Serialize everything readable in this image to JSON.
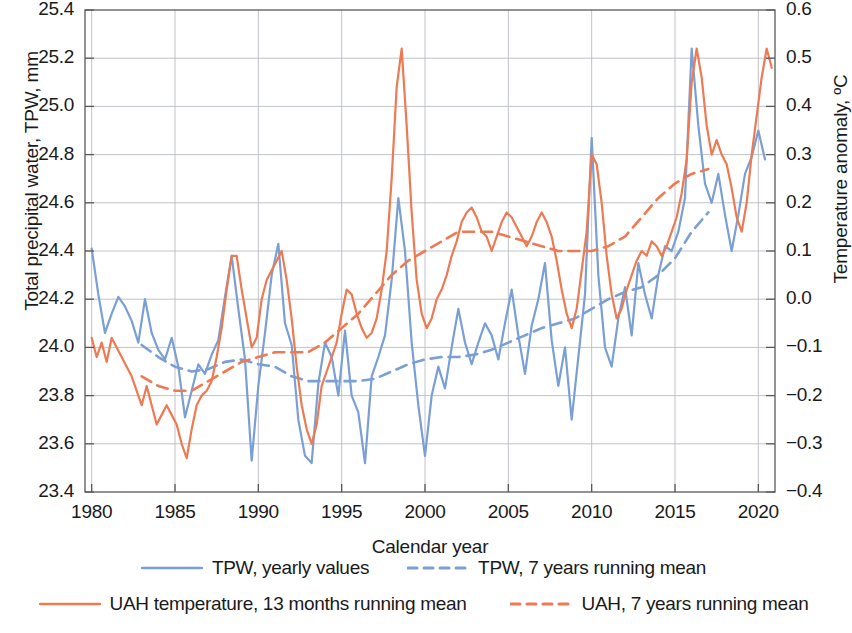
{
  "chart_data": {
    "type": "line",
    "title": "",
    "xlabel": "Calendar year",
    "ylabel": "Total precipital water, TPW, mm",
    "ylabel_right": "Temperature anomaly, ºC",
    "xlim": [
      1979.6,
      2021.0
    ],
    "ylim": [
      23.4,
      25.4
    ],
    "ylim_right": [
      -0.4,
      0.6
    ],
    "grid": true,
    "legend_position": "below",
    "xticks": [
      1980,
      1985,
      1990,
      1995,
      2000,
      2005,
      2010,
      2015,
      2020
    ],
    "xticklabels": [
      "1980",
      "1985",
      "1990",
      "1995",
      "2000",
      "2005",
      "2010",
      "2015",
      "2020"
    ],
    "yticks_left": [
      23.4,
      23.6,
      23.8,
      24.0,
      24.2,
      24.4,
      24.6,
      24.8,
      25.0,
      25.2,
      25.4
    ],
    "yticklabels_left": [
      "23.4",
      "23.6",
      "23.8",
      "24.0",
      "24.2",
      "24.4",
      "24.6",
      "24.8",
      "25.0",
      "25.2",
      "25.4"
    ],
    "yticks_right": [
      -0.4,
      -0.3,
      -0.2,
      -0.1,
      0.0,
      0.1,
      0.2,
      0.3,
      0.4,
      0.5,
      0.6
    ],
    "yticklabels_right": [
      "−0.4",
      "−0.3",
      "−0.2",
      "−0.1",
      "0.0",
      "0.1",
      "0.2",
      "0.3",
      "0.4",
      "0.5",
      "0.6"
    ],
    "colors": {
      "tpw": "#7a9fd4",
      "uah": "#ed7a52",
      "grid": "#b9bcc4",
      "frame": "#59595b"
    },
    "series": [
      {
        "name": "TPW, yearly values",
        "axis": "left",
        "color": "#7a9fd4",
        "style": "solid",
        "x": [
          1980.0,
          1980.4,
          1980.8,
          1981.2,
          1981.6,
          1982.0,
          1982.4,
          1982.8,
          1983.2,
          1983.6,
          1984.0,
          1984.4,
          1984.8,
          1985.2,
          1985.6,
          1986.0,
          1986.4,
          1986.8,
          1987.2,
          1987.6,
          1988.0,
          1988.4,
          1988.8,
          1989.2,
          1989.6,
          1990.0,
          1990.4,
          1990.8,
          1991.2,
          1991.6,
          1992.0,
          1992.4,
          1992.8,
          1993.2,
          1993.6,
          1994.0,
          1994.4,
          1994.8,
          1995.2,
          1995.6,
          1996.0,
          1996.4,
          1996.8,
          1997.2,
          1997.6,
          1998.0,
          1998.4,
          1998.8,
          1999.2,
          1999.6,
          2000.0,
          2000.4,
          2000.8,
          2001.2,
          2001.6,
          2002.0,
          2002.4,
          2002.8,
          2003.2,
          2003.6,
          2004.0,
          2004.4,
          2004.8,
          2005.2,
          2005.6,
          2006.0,
          2006.4,
          2006.8,
          2007.2,
          2007.6,
          2008.0,
          2008.4,
          2008.8,
          2009.2,
          2009.6,
          2010.0,
          2010.4,
          2010.8,
          2011.2,
          2011.6,
          2012.0,
          2012.4,
          2012.8,
          2013.2,
          2013.6,
          2014.0,
          2014.4,
          2014.8,
          2015.2,
          2015.6,
          2016.0,
          2016.4,
          2016.8,
          2017.2,
          2017.6,
          2018.0,
          2018.4,
          2018.8,
          2019.2,
          2019.6,
          2020.0,
          2020.4
        ],
        "y": [
          24.41,
          24.22,
          24.06,
          24.14,
          24.21,
          24.17,
          24.11,
          24.02,
          24.2,
          24.06,
          23.99,
          23.95,
          24.04,
          23.92,
          23.71,
          23.82,
          23.93,
          23.89,
          23.97,
          24.03,
          24.21,
          24.38,
          24.16,
          23.95,
          23.53,
          23.84,
          24.06,
          24.3,
          24.43,
          24.1,
          24.01,
          23.7,
          23.55,
          23.52,
          23.85,
          24.02,
          23.96,
          23.8,
          24.07,
          23.8,
          23.73,
          23.52,
          23.88,
          23.96,
          24.05,
          24.28,
          24.62,
          24.4,
          24.02,
          23.76,
          23.55,
          23.8,
          23.92,
          23.83,
          24.0,
          24.16,
          24.02,
          23.93,
          24.02,
          24.1,
          24.05,
          23.95,
          24.1,
          24.24,
          24.05,
          23.89,
          24.09,
          24.2,
          24.35,
          24.03,
          23.84,
          24.0,
          23.7,
          23.96,
          24.22,
          24.87,
          24.3,
          24.0,
          23.92,
          24.12,
          24.25,
          24.05,
          24.35,
          24.22,
          24.12,
          24.3,
          24.42,
          24.4,
          24.48,
          24.62,
          25.24,
          24.92,
          24.68,
          24.6,
          24.72,
          24.55,
          24.4,
          24.55,
          24.72,
          24.79,
          24.9,
          24.78
        ]
      },
      {
        "name": "TPW, 7 years running mean",
        "axis": "left",
        "color": "#7a9fd4",
        "style": "dashed",
        "x": [
          1983.0,
          1984.0,
          1985.0,
          1986.0,
          1987.0,
          1988.0,
          1989.0,
          1990.0,
          1991.0,
          1992.0,
          1993.0,
          1994.0,
          1995.0,
          1996.0,
          1997.0,
          1998.0,
          1999.0,
          2000.0,
          2001.0,
          2002.0,
          2003.0,
          2004.0,
          2005.0,
          2006.0,
          2007.0,
          2008.0,
          2009.0,
          2010.0,
          2011.0,
          2012.0,
          2013.0,
          2014.0,
          2015.0,
          2016.0,
          2017.0
        ],
        "y": [
          24.01,
          23.96,
          23.92,
          23.9,
          23.91,
          23.94,
          23.95,
          23.93,
          23.92,
          23.88,
          23.86,
          23.86,
          23.86,
          23.86,
          23.87,
          23.9,
          23.93,
          23.95,
          23.96,
          23.96,
          23.97,
          23.99,
          24.02,
          24.05,
          24.08,
          24.1,
          24.12,
          24.16,
          24.2,
          24.23,
          24.25,
          24.3,
          24.37,
          24.48,
          24.56
        ]
      },
      {
        "name": "UAH temperature, 13 months running mean",
        "axis": "right",
        "color": "#ed7a52",
        "style": "solid",
        "x": [
          1980.0,
          1980.3,
          1980.6,
          1980.9,
          1981.2,
          1981.5,
          1981.8,
          1982.1,
          1982.4,
          1982.7,
          1983.0,
          1983.3,
          1983.6,
          1983.9,
          1984.2,
          1984.5,
          1984.8,
          1985.1,
          1985.4,
          1985.7,
          1986.0,
          1986.3,
          1986.6,
          1986.9,
          1987.2,
          1987.5,
          1987.8,
          1988.1,
          1988.4,
          1988.7,
          1989.0,
          1989.3,
          1989.6,
          1989.9,
          1990.2,
          1990.5,
          1990.8,
          1991.1,
          1991.4,
          1991.7,
          1992.0,
          1992.3,
          1992.6,
          1992.9,
          1993.2,
          1993.5,
          1993.8,
          1994.1,
          1994.4,
          1994.7,
          1995.0,
          1995.3,
          1995.6,
          1995.9,
          1996.2,
          1996.5,
          1996.8,
          1997.1,
          1997.4,
          1997.7,
          1998.0,
          1998.3,
          1998.6,
          1998.9,
          1999.2,
          1999.5,
          1999.8,
          2000.1,
          2000.4,
          2000.7,
          2001.0,
          2001.3,
          2001.6,
          2001.9,
          2002.2,
          2002.5,
          2002.8,
          2003.1,
          2003.4,
          2003.7,
          2004.0,
          2004.3,
          2004.6,
          2004.9,
          2005.2,
          2005.5,
          2005.8,
          2006.1,
          2006.4,
          2006.7,
          2007.0,
          2007.3,
          2007.6,
          2007.9,
          2008.2,
          2008.5,
          2008.8,
          2009.1,
          2009.4,
          2009.7,
          2010.0,
          2010.3,
          2010.6,
          2010.9,
          2011.2,
          2011.5,
          2011.8,
          2012.1,
          2012.4,
          2012.7,
          2013.0,
          2013.3,
          2013.6,
          2013.9,
          2014.2,
          2014.5,
          2014.8,
          2015.1,
          2015.4,
          2015.7,
          2016.0,
          2016.3,
          2016.6,
          2016.9,
          2017.2,
          2017.5,
          2017.8,
          2018.1,
          2018.4,
          2018.7,
          2019.0,
          2019.3,
          2019.6,
          2019.9,
          2020.2,
          2020.5,
          2020.8
        ],
        "y": [
          -0.08,
          -0.12,
          -0.09,
          -0.13,
          -0.08,
          -0.1,
          -0.12,
          -0.14,
          -0.16,
          -0.19,
          -0.22,
          -0.18,
          -0.22,
          -0.26,
          -0.24,
          -0.22,
          -0.24,
          -0.26,
          -0.3,
          -0.33,
          -0.27,
          -0.22,
          -0.2,
          -0.19,
          -0.17,
          -0.12,
          -0.06,
          0.02,
          0.09,
          0.09,
          0.02,
          -0.04,
          -0.1,
          -0.08,
          0.0,
          0.04,
          0.06,
          0.08,
          0.1,
          0.04,
          -0.04,
          -0.14,
          -0.22,
          -0.27,
          -0.3,
          -0.26,
          -0.18,
          -0.15,
          -0.12,
          -0.09,
          -0.03,
          0.02,
          0.01,
          -0.03,
          -0.06,
          -0.08,
          -0.07,
          -0.04,
          0.02,
          0.1,
          0.25,
          0.44,
          0.52,
          0.36,
          0.18,
          0.04,
          -0.03,
          -0.06,
          -0.04,
          0.0,
          0.02,
          0.05,
          0.09,
          0.12,
          0.16,
          0.18,
          0.19,
          0.17,
          0.14,
          0.13,
          0.1,
          0.13,
          0.16,
          0.18,
          0.17,
          0.15,
          0.13,
          0.11,
          0.13,
          0.16,
          0.18,
          0.16,
          0.13,
          0.08,
          0.02,
          -0.03,
          -0.06,
          -0.02,
          0.06,
          0.14,
          0.3,
          0.28,
          0.2,
          0.09,
          0.01,
          -0.04,
          -0.02,
          0.02,
          0.05,
          0.08,
          0.1,
          0.09,
          0.12,
          0.11,
          0.09,
          0.11,
          0.14,
          0.17,
          0.22,
          0.29,
          0.45,
          0.52,
          0.46,
          0.36,
          0.3,
          0.33,
          0.3,
          0.28,
          0.23,
          0.17,
          0.14,
          0.2,
          0.3,
          0.38,
          0.46,
          0.52,
          0.48
        ]
      },
      {
        "name": "UAH, 7 years running mean",
        "axis": "right",
        "color": "#ed7a52",
        "style": "dashed",
        "x": [
          1983.0,
          1984.0,
          1985.0,
          1986.0,
          1987.0,
          1988.0,
          1989.0,
          1990.0,
          1991.0,
          1992.0,
          1993.0,
          1994.0,
          1995.0,
          1996.0,
          1997.0,
          1998.0,
          1999.0,
          2000.0,
          2001.0,
          2002.0,
          2003.0,
          2004.0,
          2005.0,
          2006.0,
          2007.0,
          2008.0,
          2009.0,
          2010.0,
          2011.0,
          2012.0,
          2013.0,
          2014.0,
          2015.0,
          2016.0,
          2017.0
        ],
        "y": [
          -0.16,
          -0.18,
          -0.19,
          -0.19,
          -0.17,
          -0.15,
          -0.13,
          -0.12,
          -0.11,
          -0.11,
          -0.11,
          -0.09,
          -0.06,
          -0.03,
          0.01,
          0.05,
          0.08,
          0.1,
          0.12,
          0.14,
          0.14,
          0.14,
          0.13,
          0.12,
          0.11,
          0.1,
          0.1,
          0.1,
          0.11,
          0.13,
          0.17,
          0.21,
          0.24,
          0.26,
          0.27
        ]
      }
    ]
  },
  "legend": {
    "rows": [
      [
        {
          "label": "TPW, yearly values",
          "color": "#7a9fd4",
          "style": "solid"
        },
        {
          "label": "TPW, 7 years running mean",
          "color": "#7a9fd4",
          "style": "dashed"
        }
      ],
      [
        {
          "label": "UAH temperature, 13 months running mean",
          "color": "#ed7a52",
          "style": "solid"
        },
        {
          "label": "UAH, 7 years running mean",
          "color": "#ed7a52",
          "style": "dashed"
        }
      ]
    ]
  }
}
